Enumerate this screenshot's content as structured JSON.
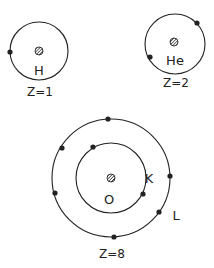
{
  "atoms": [
    {
      "symbol": "H",
      "z_label": "Z=1",
      "shells": [
        {
          "name": "",
          "electrons": 1
        }
      ]
    },
    {
      "symbol": "He",
      "z_label": "Z=2",
      "shells": [
        {
          "name": "",
          "electrons": 2
        }
      ]
    },
    {
      "symbol": "O",
      "z_label": "Z=8",
      "shells": [
        {
          "name": "K",
          "electrons": 2
        },
        {
          "name": "L",
          "electrons": 6
        }
      ]
    }
  ]
}
